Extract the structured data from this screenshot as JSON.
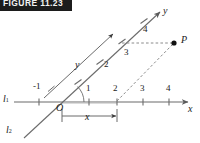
{
  "banner": {
    "text": "FIGURE 11.23"
  },
  "figure": {
    "colors": {
      "axis": "#6b6b6b",
      "line": "#6b6b6b",
      "dashed": "#8a8a8a",
      "point": "#111111",
      "text": "#1a1a1a",
      "banner_bg": "#1c1c1c",
      "banner_text": "#f2f2f2",
      "background": "#ffffff"
    },
    "lines": {
      "l1_label": "l",
      "l1_sub": "1",
      "l2_label": "l",
      "l2_sub": "2"
    },
    "axes": {
      "x_label": "x",
      "y_label": "y"
    },
    "x_ticks": [
      "-1",
      "1",
      "2",
      "3",
      "4"
    ],
    "y_ticks": [
      "1",
      "2",
      "3",
      "4"
    ],
    "parallel_line_label": "y",
    "point_label": "P",
    "measure_label": "x",
    "origin_label": "O",
    "minus_one_label": "−1"
  }
}
